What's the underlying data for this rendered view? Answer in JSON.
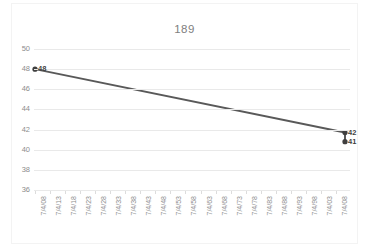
{
  "chart_data": {
    "type": "line",
    "title": "189",
    "xlabel": "",
    "ylabel": "",
    "grid": true,
    "legend": "none",
    "ylim": [
      36,
      50
    ],
    "yticks": [
      50,
      48,
      46,
      44,
      42,
      40,
      38,
      36
    ],
    "categories": [
      "7/4/08",
      "7/4/13",
      "7/4/18",
      "7/4/23",
      "7/4/28",
      "7/4/33",
      "7/4/38",
      "7/4/43",
      "7/4/48",
      "7/4/53",
      "7/4/58",
      "7/4/63",
      "7/4/68",
      "7/4/73",
      "7/4/78",
      "7/4/83",
      "7/4/88",
      "7/4/93",
      "7/4/98",
      "7/4/03",
      "7/4/08"
    ],
    "series": [
      {
        "name": "189",
        "color": "#595959",
        "points": [
          {
            "category": "7/4/08",
            "x": 0,
            "value": 48,
            "label": "48"
          },
          {
            "category": "end",
            "x": 20.6,
            "value": 41.7,
            "label": "42"
          },
          {
            "category": "end",
            "x": 20.6,
            "value": 40.8,
            "label": "41"
          }
        ]
      }
    ],
    "colors": {
      "line": "#595959",
      "marker": "#3f3f3f",
      "gridline": "#e9e9e9",
      "axis_text": "#8c8c8c",
      "title_text": "#808080",
      "label_text": "#3f3f3f",
      "background": "#ffffff",
      "border": "#f3f3f3"
    }
  }
}
